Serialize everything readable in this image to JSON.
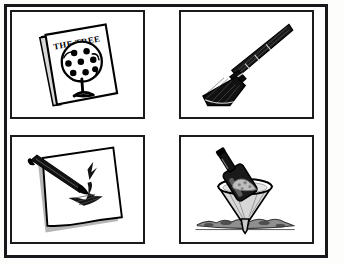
{
  "artwork": {
    "title": "Four-panel black and white line drawings",
    "style": "hand-drawn ink illustration",
    "frame_color": "#17181a",
    "paper_color": "#ffffff",
    "ink_color": "#000000",
    "layout": "2x2 grid inside a hand-drawn outer border"
  },
  "panels": [
    {
      "id": "panel-book",
      "position": "top-left",
      "subject": "book-with-tree-cover",
      "description": "A tilted closed book whose cover shows a round tree with dark round fruit and a trunk, with handwritten title text above and below.",
      "cover_title_text": "THE TREE",
      "cover_subtitle_text": "a story",
      "fruit_count": 8
    },
    {
      "id": "panel-broom",
      "position": "top-right",
      "subject": "broom",
      "description": "A broom drawn diagonally with a long handle at the upper right and a dark flared bristle head at the lower left.",
      "orientation": "diagonal, handle upper-right, bristles lower-left"
    },
    {
      "id": "panel-brush-paper",
      "position": "bottom-left",
      "subject": "brush-and-paper",
      "description": "A tilted sheet of white paper with a drop shadow, a dark tapered brush or pen lying across it, and a bird-like ink stroke painted on the sheet.",
      "elements": [
        "paper-sheet",
        "brush",
        "ink-bird-mark"
      ]
    },
    {
      "id": "panel-bottle-funnel",
      "position": "bottom-right",
      "subject": "bottle-pouring-into-funnel",
      "description": "A dark tilted bottle pouring its contents into a wide funnel that stands with its spout in loose soil.",
      "elements": [
        "bottle",
        "funnel",
        "ground-soil"
      ]
    }
  ]
}
